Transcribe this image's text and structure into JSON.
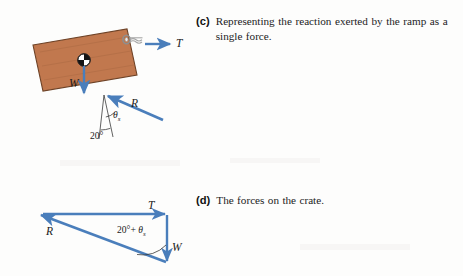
{
  "page": {
    "background_color": "#fdfdfc",
    "width": 463,
    "height": 276
  },
  "colors": {
    "crate_fill": "#c1784e",
    "crate_stroke": "#6e4226",
    "vector_blue": "#4a7ebb",
    "construction_line": "#3a3a3a",
    "hardware_gray": "#9a9a9a",
    "text": "#1c1c1c"
  },
  "captions": {
    "c": {
      "tag": "(c)",
      "text": "Representing the reaction exerted by the ramp as a single force."
    },
    "d": {
      "tag": "(d)",
      "text": "The forces on the crate."
    }
  },
  "figure_c": {
    "name": "crate-on-ramp-free-body-diagram",
    "crate": {
      "label": "crate",
      "rotation_degrees": -20
    },
    "hardware": {
      "label": "eye-bolt-ring"
    },
    "vectors": [
      {
        "name": "tension",
        "label": "T",
        "direction": "right"
      },
      {
        "name": "weight",
        "label": "W",
        "direction": "down"
      },
      {
        "name": "reaction",
        "label": "R",
        "direction": "up-left"
      }
    ],
    "angles": [
      {
        "name": "friction-angle",
        "label": "θ",
        "subscript": "s"
      },
      {
        "name": "ramp-angle",
        "label": "20°"
      }
    ]
  },
  "figure_d": {
    "name": "force-triangle",
    "vectors": [
      {
        "name": "tension",
        "label": "T",
        "direction": "right"
      },
      {
        "name": "weight",
        "label": "W",
        "direction": "down"
      },
      {
        "name": "reaction",
        "label": "R",
        "direction": "up-left"
      }
    ],
    "angles": [
      {
        "name": "combined-angle",
        "prefix": "20°+ ",
        "symbol": "θ",
        "subscript": "s"
      }
    ]
  }
}
